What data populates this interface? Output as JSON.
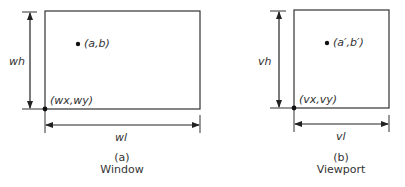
{
  "window": {
    "height_label": "wh",
    "width_label": "wl",
    "origin_label": "(wx,wy)",
    "point_label": "(a,b)",
    "caption_letter": "(a)",
    "caption_title": "Window"
  },
  "viewport": {
    "height_label": "vh",
    "width_label": "vl",
    "origin_label": "(vx,vy)",
    "point_label": "(a′,b′)",
    "caption_letter": "(b)",
    "caption_title": "Viewport"
  }
}
